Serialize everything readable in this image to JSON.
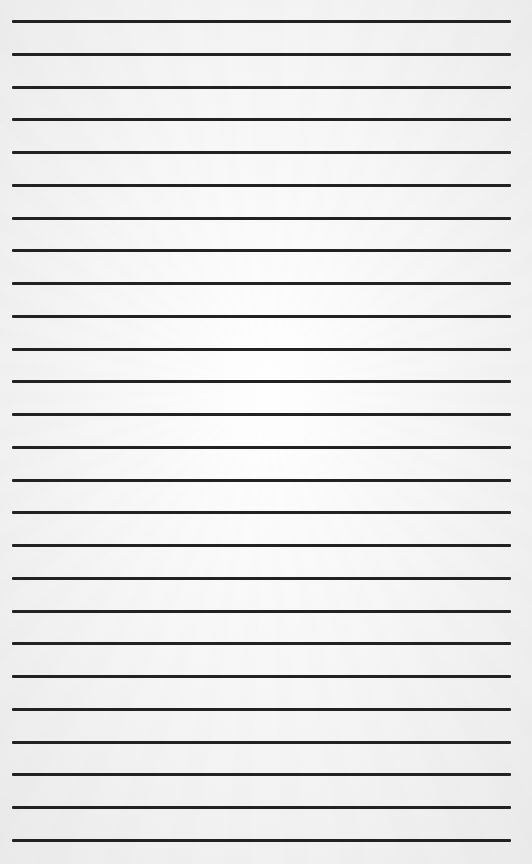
{
  "page": {
    "type": "lined-paper",
    "background_color": "#f4f4f4",
    "line_color": "#222222",
    "line_count": 26,
    "first_line_y": 20,
    "line_spacing": 32.76,
    "line_left": 12,
    "line_right": 511,
    "line_thickness": 3
  }
}
